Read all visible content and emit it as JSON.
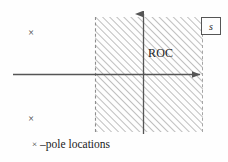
{
  "figure": {
    "type": "s-plane-roc-diagram",
    "plane_label": "s",
    "roc_label": "ROC",
    "legend": {
      "marker": "×",
      "text": "–pole locations"
    },
    "poles": [
      {
        "name": "pole-upper-left",
        "marker": "×",
        "x": 31,
        "y": 33
      },
      {
        "name": "pole-lower-left",
        "marker": "×",
        "x": 31,
        "y": 119
      }
    ],
    "axes": {
      "real_axis": {
        "y": 74,
        "x_start": 13,
        "x_end": 204,
        "arrow": "right"
      },
      "imag_axis": {
        "x": 143,
        "y_start": 10,
        "y_end": 134,
        "arrow": "up"
      }
    },
    "roc_region": {
      "left": 95,
      "right": 203,
      "top": 17,
      "bottom": 132,
      "hatch_angle_deg": 45,
      "hatch_spacing_px": 5,
      "boundary_style": "dashed",
      "fill": "none",
      "stroke_color": "#777777"
    },
    "colors": {
      "background": "#fefefe",
      "axis": "#555555",
      "hatch": "#8a8a8a",
      "text": "#1a1a1a",
      "box_border": "#555555"
    }
  }
}
